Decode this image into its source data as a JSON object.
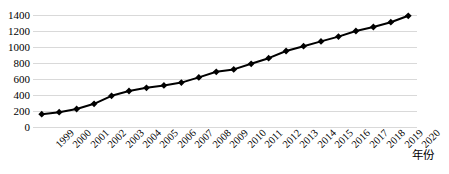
{
  "chart_data": {
    "type": "line",
    "title": "",
    "subtitle": "",
    "xlabel": "年份",
    "ylabel": "",
    "categories": [
      "1999",
      "2000",
      "2001",
      "2002",
      "2003",
      "2004",
      "2005",
      "2006",
      "2007",
      "2008",
      "2009",
      "2010",
      "2011",
      "2012",
      "2013",
      "2014",
      "2015",
      "2016",
      "2017",
      "2018",
      "2019",
      "2020"
    ],
    "values": [
      160,
      185,
      225,
      290,
      390,
      450,
      490,
      520,
      555,
      620,
      690,
      720,
      790,
      860,
      950,
      1010,
      1070,
      1130,
      1200,
      1250,
      1310,
      1390
    ],
    "series": [
      {
        "name": "",
        "values": [
          160,
          185,
          225,
          290,
          390,
          450,
          490,
          520,
          555,
          620,
          690,
          720,
          790,
          860,
          950,
          1010,
          1070,
          1130,
          1200,
          1250,
          1310,
          1390
        ]
      }
    ],
    "ylim": [
      0,
      1400
    ],
    "y_ticks": [
      0,
      200,
      400,
      600,
      800,
      1000,
      1200,
      1400
    ],
    "y_tick_labels": [
      "0",
      "200",
      "400",
      "600",
      "800",
      "1000",
      "1200",
      "1400"
    ],
    "grid": true,
    "grid_axis": "y",
    "legend": false,
    "legend_position": "none",
    "marker": "diamond",
    "marker_color": "#000000",
    "line_color": "#000000",
    "line_width": 2,
    "grid_color": "#d9d9d9",
    "background_color": "#ffffff",
    "x_tick_rotation": -45
  }
}
